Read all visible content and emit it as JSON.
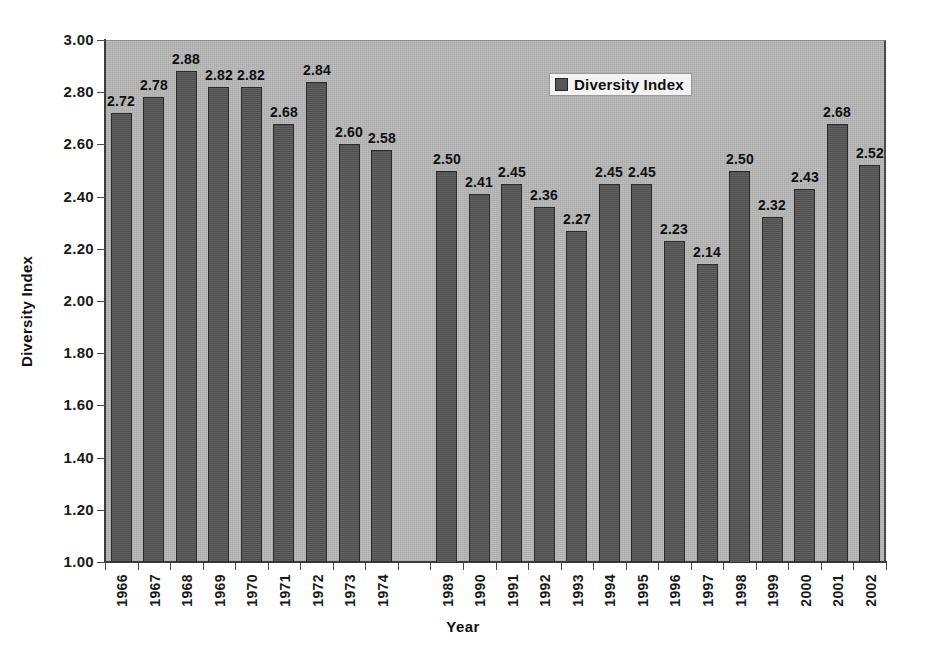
{
  "chart_data": {
    "type": "bar",
    "title": "",
    "xlabel": "Year",
    "ylabel": "Diversity Index",
    "ylim": [
      1.0,
      3.0
    ],
    "ytick_step": 0.2,
    "yticks": [
      "3.00",
      "2.80",
      "2.60",
      "2.40",
      "2.20",
      "2.00",
      "1.80",
      "1.60",
      "1.40",
      "1.20",
      "1.00"
    ],
    "grid": false,
    "legend": {
      "position": "top-center-right",
      "entries": [
        {
          "name": "Diversity Index",
          "color": "#565656"
        }
      ]
    },
    "categories": [
      "1966",
      "1967",
      "1968",
      "1969",
      "1970",
      "1971",
      "1972",
      "1973",
      "1974",
      "",
      "1989",
      "1990",
      "1991",
      "1992",
      "1993",
      "1994",
      "1995",
      "1996",
      "1997",
      "1998",
      "1999",
      "2000",
      "2001",
      "2002"
    ],
    "values": [
      2.72,
      2.78,
      2.88,
      2.82,
      2.82,
      2.68,
      2.84,
      2.6,
      2.58,
      null,
      2.5,
      2.41,
      2.45,
      2.36,
      2.27,
      2.45,
      2.45,
      2.23,
      2.14,
      2.5,
      2.32,
      2.43,
      2.68,
      2.52
    ],
    "value_labels": [
      "2.72",
      "2.78",
      "2.88",
      "2.82",
      "2.82",
      "2.68",
      "2.84",
      "2.60",
      "2.58",
      "",
      "2.50",
      "2.41",
      "2.45",
      "2.36",
      "2.27",
      "2.45",
      "2.45",
      "2.23",
      "2.14",
      "2.50",
      "2.32",
      "2.43",
      "2.68",
      "2.52"
    ],
    "series": [
      {
        "name": "Diversity Index",
        "values": [
          2.72,
          2.78,
          2.88,
          2.82,
          2.82,
          2.68,
          2.84,
          2.6,
          2.58,
          null,
          2.5,
          2.41,
          2.45,
          2.36,
          2.27,
          2.45,
          2.45,
          2.23,
          2.14,
          2.5,
          2.32,
          2.43,
          2.68,
          2.52
        ]
      }
    ]
  },
  "colors": {
    "bar": "#565656",
    "bar_border": "#2b2b2b",
    "plot_background": "#b6b6b6",
    "axis": "#3d3d3d",
    "text": "#101010",
    "figure_background": "#ffffff"
  }
}
